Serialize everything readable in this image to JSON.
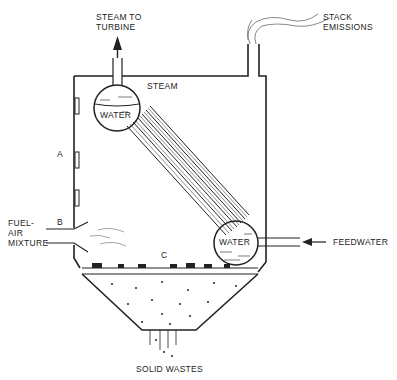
{
  "diagram": {
    "type": "boiler-incinerator schematic",
    "labels": {
      "steam_to_turbine": "STEAM TO\nTURBINE",
      "stack_emissions": "STACK\nEMISSIONS",
      "steam": "STEAM",
      "water_upper": "WATER",
      "water_lower": "WATER",
      "fuel_air": "FUEL-\nAIR\nMIXTURE",
      "feedwater": "FEEDWATER",
      "solid_wastes": "SOLID WASTES",
      "zone_a": "A",
      "zone_b": "B",
      "zone_c": "C"
    },
    "colors": {
      "line": "#222222",
      "background": "#ffffff"
    }
  }
}
